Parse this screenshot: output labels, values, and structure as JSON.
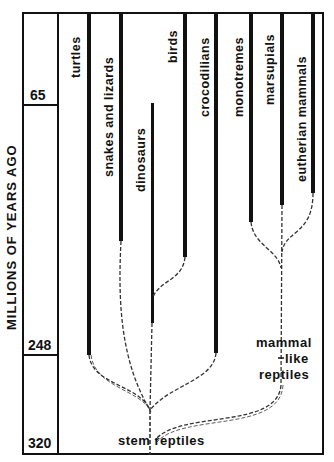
{
  "diagram": {
    "type": "phylogenetic-tree",
    "axis": {
      "title": "MILLIONS OF YEARS AGO",
      "ticks": [
        "65",
        "248",
        "320"
      ]
    },
    "taxa": [
      {
        "name": "turtles"
      },
      {
        "name": "snakes and lizards"
      },
      {
        "name": "dinosaurs"
      },
      {
        "name": "birds"
      },
      {
        "name": "crocodilians"
      },
      {
        "name": "monotremes"
      },
      {
        "name": "marsupials"
      },
      {
        "name": "eutherian mammals"
      }
    ],
    "ancestral_labels": {
      "stem": "stem reptiles",
      "mammal_like_1": "mammal",
      "mammal_like_2": "like",
      "mammal_like_3": "reptiles"
    },
    "colors": {
      "line": "#111111",
      "background": "#ffffff"
    }
  }
}
